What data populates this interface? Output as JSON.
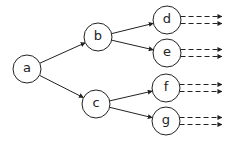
{
  "diagram": {
    "type": "tree",
    "nodes": [
      {
        "id": "a",
        "label": "a",
        "x": 27,
        "y": 69
      },
      {
        "id": "b",
        "label": "b",
        "x": 98,
        "y": 37
      },
      {
        "id": "c",
        "label": "c",
        "x": 96,
        "y": 104
      },
      {
        "id": "d",
        "label": "d",
        "x": 167,
        "y": 20
      },
      {
        "id": "e",
        "label": "e",
        "x": 167,
        "y": 53
      },
      {
        "id": "f",
        "label": "f",
        "x": 166,
        "y": 88
      },
      {
        "id": "g",
        "label": "g",
        "x": 166,
        "y": 121
      }
    ],
    "edges": [
      {
        "from": "a",
        "to": "b",
        "style": "solid"
      },
      {
        "from": "a",
        "to": "c",
        "style": "solid"
      },
      {
        "from": "b",
        "to": "d",
        "style": "solid"
      },
      {
        "from": "b",
        "to": "e",
        "style": "solid"
      },
      {
        "from": "c",
        "to": "f",
        "style": "solid"
      },
      {
        "from": "c",
        "to": "g",
        "style": "solid"
      }
    ],
    "continuations": [
      {
        "from": "d",
        "count": 2,
        "style": "dashed"
      },
      {
        "from": "e",
        "count": 2,
        "style": "dashed"
      },
      {
        "from": "f",
        "count": 2,
        "style": "dashed"
      },
      {
        "from": "g",
        "count": 2,
        "style": "dashed"
      }
    ],
    "colors": {
      "stroke": "#222222",
      "background": "#ffffff"
    }
  }
}
